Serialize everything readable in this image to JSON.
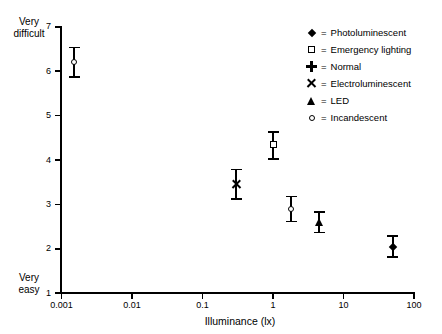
{
  "chart_data": {
    "type": "scatter",
    "title": "",
    "xlabel": "Illuminance (lx)",
    "ylabel": "",
    "xscale": "log",
    "xlim": [
      0.001,
      100
    ],
    "ylim": [
      1,
      7
    ],
    "grid": false,
    "legend_position": "top-right",
    "y_axis_anchor_high": "Very\ndifficult",
    "y_axis_anchor_low": "Very\neasy",
    "y_anchor_high_line1": "Very",
    "y_anchor_high_line2": "difficult",
    "y_anchor_low_line1": "Very",
    "y_anchor_low_line2": "easy",
    "xticks": [
      "0.001",
      "0.01",
      "0.1",
      "1",
      "10",
      "100"
    ],
    "xtick_values": [
      0.001,
      0.01,
      0.1,
      1,
      10,
      100
    ],
    "yticks": [
      "1",
      "2",
      "3",
      "4",
      "5",
      "6",
      "7"
    ],
    "ytick_values": [
      1,
      2,
      3,
      4,
      5,
      6,
      7
    ],
    "series": [
      {
        "name": "Photoluminescent",
        "marker": "circle",
        "x": 0.0015,
        "y": 6.2,
        "yerr_low": 5.85,
        "yerr_high": 6.55
      },
      {
        "name": "Electroluminescent",
        "marker": "x",
        "x": 0.3,
        "y": 3.45,
        "yerr_low": 3.1,
        "yerr_high": 3.8
      },
      {
        "name": "Emergency lighting",
        "marker": "square",
        "x": 1.0,
        "y": 4.35,
        "yerr_low": 4.0,
        "yerr_high": 4.65
      },
      {
        "name": "Incandescent",
        "marker": "circle",
        "x": 1.8,
        "y": 2.9,
        "yerr_low": 2.6,
        "yerr_high": 3.2
      },
      {
        "name": "LED",
        "marker": "triangle",
        "x": 4.5,
        "y": 2.6,
        "yerr_low": 2.35,
        "yerr_high": 2.85
      },
      {
        "name": "Normal",
        "marker": "diamond",
        "x": 50,
        "y": 2.05,
        "yerr_low": 1.8,
        "yerr_high": 2.3
      }
    ]
  },
  "legend": {
    "equals": "=",
    "items": [
      {
        "marker": "diamond",
        "label": "Photoluminescent"
      },
      {
        "marker": "square",
        "label": "Emergency lighting"
      },
      {
        "marker": "plus",
        "label": "Normal"
      },
      {
        "marker": "x",
        "label": "Electroluminescent"
      },
      {
        "marker": "triangle",
        "label": "LED"
      },
      {
        "marker": "circle",
        "label": "Incandescent"
      }
    ]
  },
  "colors": {
    "ink": "#000000",
    "background": "#ffffff"
  }
}
